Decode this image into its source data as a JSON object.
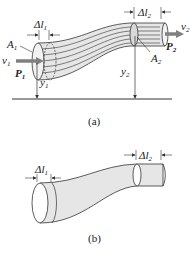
{
  "figure_a": {
    "caption": "(a)",
    "labels": {
      "dl1": "Δl",
      "dl1_sub": "1",
      "dl2": "Δl",
      "dl2_sub": "2",
      "A1": "A",
      "A1_sub": "1",
      "A2": "A",
      "A2_sub": "2",
      "v1": "v",
      "v1_sub": "1",
      "v2": "v",
      "v2_sub": "2",
      "P1": "P",
      "P1_sub": "1",
      "P2": "P",
      "P2_sub": "2",
      "y1": "y",
      "y1_sub": "1",
      "y2": "y",
      "y2_sub": "2"
    }
  },
  "figure_b": {
    "caption": "(b)",
    "labels": {
      "dl1": "Δl",
      "dl1_sub": "1",
      "dl2": "Δl",
      "dl2_sub": "2"
    }
  },
  "colors": {
    "tube_fill": "#e6e6e6",
    "stroke": "#333333",
    "arrow": "#808080"
  }
}
